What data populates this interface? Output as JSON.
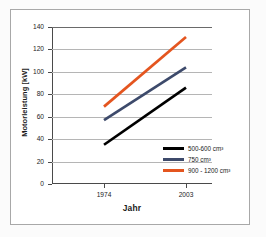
{
  "chart_data": {
    "type": "line",
    "title": "",
    "xlabel": "Jahr",
    "ylabel": "Motorleistung [kW]",
    "categories": [
      "1974",
      "2003"
    ],
    "x": [
      1974,
      2003
    ],
    "ylim": [
      0,
      140
    ],
    "yticks": [
      0,
      20,
      40,
      60,
      80,
      100,
      120,
      140
    ],
    "ytick_labels": [
      "0",
      "20",
      "40",
      "60",
      "80",
      "100",
      "120",
      "140"
    ],
    "grid": "horizontal",
    "legend_position": "inside-bottom-right",
    "series": [
      {
        "name": "500-600 cm³",
        "color": "#000000",
        "values": [
          35,
          86
        ]
      },
      {
        "name": "750 cm³",
        "color": "#3d4a6b",
        "values": [
          57,
          104
        ]
      },
      {
        "name": "900 - 1200 cm³",
        "color": "#e4551f",
        "values": [
          69,
          131
        ]
      }
    ]
  },
  "legend": {
    "items": [
      {
        "label": "500-600 cm³",
        "color": "#000000"
      },
      {
        "label": "750 cm³",
        "color": "#3d4a6b"
      },
      {
        "label": "900 - 1200 cm³",
        "color": "#e4551f"
      }
    ]
  },
  "axes": {
    "y_title": "Motorleistung [kW]",
    "x_title": "Jahr",
    "y_tick_labels": [
      "140",
      "120",
      "100",
      "80",
      "60",
      "40",
      "20",
      "0"
    ],
    "x_tick_labels": [
      "1974",
      "2003"
    ]
  },
  "colors": {
    "frame": "#a8a8a8",
    "gridline": "#b5b5b5",
    "axis": "#4a4a4a",
    "text": "#1a1a1a",
    "series_1": "#000000",
    "series_2": "#3d4a6b",
    "series_3": "#e4551f"
  }
}
